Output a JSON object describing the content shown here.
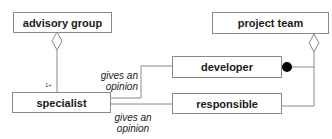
{
  "diagram": {
    "type": "uml-class-diagram",
    "classes": {
      "advisory_group": "advisory group",
      "project_team": "project team",
      "developer": "developer",
      "specialist": "specialist",
      "responsible": "responsible"
    },
    "associations": {
      "specialist_developer": "gives an\nopinion",
      "specialist_developer_line1": "gives an",
      "specialist_developer_line2": "opinion",
      "specialist_responsible_line1": "gives an",
      "specialist_responsible_line2": "opinion"
    },
    "multiplicities": {
      "advisory_group_specialist": "1+"
    },
    "relationships": [
      {
        "from": "advisory group",
        "to": "specialist",
        "kind": "aggregation",
        "multiplicity": "1+"
      },
      {
        "from": "project team",
        "to": "developer",
        "kind": "aggregation",
        "end": "filled-circle"
      },
      {
        "from": "project team",
        "to": "responsible",
        "kind": "aggregation"
      },
      {
        "from": "specialist",
        "to": "developer",
        "kind": "association",
        "label": "gives an opinion"
      },
      {
        "from": "specialist",
        "to": "responsible",
        "kind": "association",
        "label": "gives an opinion"
      }
    ],
    "colors": {
      "line": "#8a8a8a",
      "text": "#1a1a1a",
      "filled_circle": "#000000"
    }
  }
}
